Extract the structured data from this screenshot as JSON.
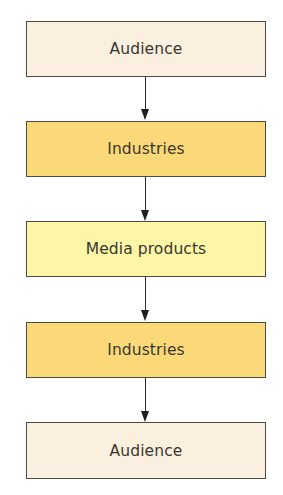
{
  "diagram": {
    "type": "vertical-flowchart",
    "colors": {
      "audience": "#fbefdf",
      "industries": "#fbd978",
      "media_products": "#fdf6a6",
      "border": "#4d4a45",
      "arrow": "#222222",
      "text": "#3a3733"
    },
    "nodes": [
      {
        "id": "n1",
        "label": "Audience",
        "color_key": "audience"
      },
      {
        "id": "n2",
        "label": "Industries",
        "color_key": "industries"
      },
      {
        "id": "n3",
        "label": "Media products",
        "color_key": "media_products"
      },
      {
        "id": "n4",
        "label": "Industries",
        "color_key": "industries"
      },
      {
        "id": "n5",
        "label": "Audience",
        "color_key": "audience"
      }
    ],
    "edges": [
      {
        "from": "n1",
        "to": "n2"
      },
      {
        "from": "n2",
        "to": "n3"
      },
      {
        "from": "n3",
        "to": "n4"
      },
      {
        "from": "n4",
        "to": "n5"
      }
    ]
  }
}
